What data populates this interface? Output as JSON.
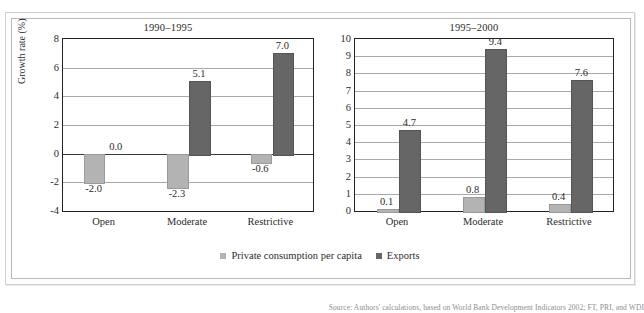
{
  "figure": {
    "top_cut_text": "",
    "bottom_caption": "Source: Authors' calculations, based on World Bank Development Indicators 2002; FT, PRI, and WDI",
    "legend": [
      {
        "key": "private-consumption",
        "label": "Private consumption per capita",
        "color": "#b3b3b3"
      },
      {
        "key": "exports",
        "label": "Exports",
        "color": "#666666"
      }
    ]
  },
  "chart_data": [
    {
      "id": "panel-1990-1995",
      "type": "bar",
      "title": "1990–1995",
      "xlabel": "",
      "ylabel": "Growth rate (%)",
      "ylim": [
        -4,
        8
      ],
      "ytick_step": 2,
      "yticks": [
        "8",
        "6",
        "4",
        "2",
        "0",
        "-2",
        "-4"
      ],
      "grid": true,
      "legend_position": "bottom-shared",
      "categories": [
        "Open",
        "Moderate",
        "Restrictive"
      ],
      "series": [
        {
          "name": "Private consumption per capita",
          "color": "#b3b3b3",
          "values": [
            -2.0,
            -2.3,
            -0.6
          ],
          "labels": [
            "-2.0",
            "-2.3",
            "-0.6"
          ]
        },
        {
          "name": "Exports",
          "color": "#666666",
          "values": [
            0.0,
            5.1,
            7.0
          ],
          "labels": [
            "0.0",
            "5.1",
            "7.0"
          ]
        }
      ]
    },
    {
      "id": "panel-1995-2000",
      "type": "bar",
      "title": "1995–2000",
      "xlabel": "",
      "ylabel": "",
      "ylim": [
        0,
        10
      ],
      "ytick_step": 1,
      "yticks": [
        "10",
        "9",
        "8",
        "7",
        "6",
        "5",
        "4",
        "3",
        "2",
        "1",
        "0"
      ],
      "grid": true,
      "legend_position": "bottom-shared",
      "categories": [
        "Open",
        "Moderate",
        "Restrictive"
      ],
      "series": [
        {
          "name": "Private consumption per capita",
          "color": "#b3b3b3",
          "values": [
            0.1,
            0.8,
            0.4
          ],
          "labels": [
            "0.1",
            "0.8",
            "0.4"
          ]
        },
        {
          "name": "Exports",
          "color": "#666666",
          "values": [
            4.7,
            9.4,
            7.6
          ],
          "labels": [
            "4.7",
            "9.4",
            "7.6"
          ]
        }
      ]
    }
  ]
}
